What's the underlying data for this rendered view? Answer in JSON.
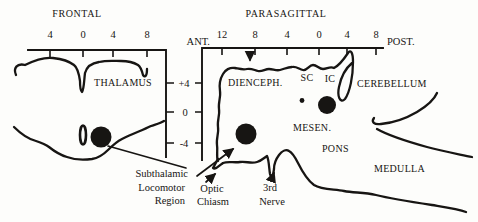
{
  "colors": {
    "ink": "#171513",
    "background": "#fdfdfb"
  },
  "frontal": {
    "title": "FRONTAL",
    "x_ticks": [
      "4",
      "0",
      "4",
      "8"
    ],
    "thalamus": "THALAMUS"
  },
  "parasagittal": {
    "title": "PARASAGITTAL",
    "ant": "ANT.",
    "post": "POST.",
    "x_ticks": [
      "12",
      "8",
      "4",
      "0",
      "4",
      "8"
    ],
    "diencephalon": "DIENCEPH.",
    "superior_colliculus": "SC",
    "inferior_colliculus": "IC",
    "cerebellum": "CEREBELLUM",
    "mesencephalon": "MESEN.",
    "pons": "PONS",
    "medulla": "MEDULLA"
  },
  "y_axis": {
    "ticks": [
      "+4",
      "0",
      "-4"
    ]
  },
  "annotations": {
    "subthalamic_line1": "Subthalamic",
    "subthalamic_line2": "Locomotor",
    "subthalamic_line3": "Region",
    "optic_line1": "Optic",
    "optic_line2": "Chiasm",
    "nerve_line1": "3rd",
    "nerve_line2": "Nerve"
  }
}
